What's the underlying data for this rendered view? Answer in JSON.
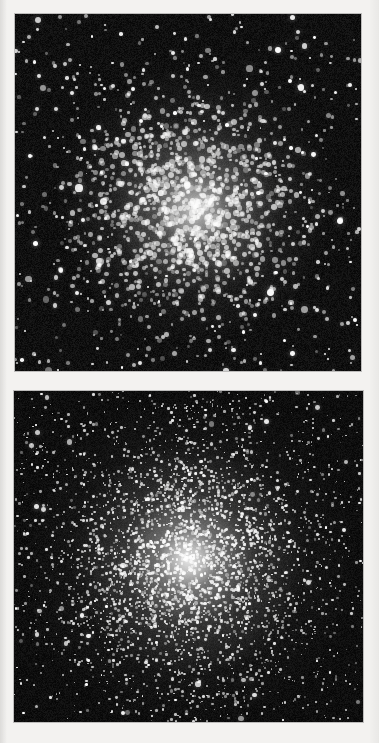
{
  "page": {
    "background_color": "#f3f2f0",
    "width": 379,
    "height": 743,
    "caption": ""
  },
  "figure": {
    "type": "astronomical-image-pair",
    "panels": [
      {
        "id": "panel-a",
        "position": "top",
        "label": "",
        "background_color": "#050505",
        "star_color": "#ffffff",
        "x": 15,
        "y": 14,
        "width": 346,
        "height": 357,
        "cluster_center_x_pct": 52,
        "cluster_center_y_pct": 54,
        "appearance": "coarsely resolved cluster; large blobby stars, mottled grainy core, moderately sparse surrounding field",
        "core_brightness": "medium-high",
        "star_count_estimate": 1750
      },
      {
        "id": "panel-b",
        "position": "bottom",
        "label": "",
        "background_color": "#050505",
        "star_color": "#ffffff",
        "x": 14,
        "y": 391,
        "width": 349,
        "height": 331,
        "cluster_center_x_pct": 50,
        "cluster_center_y_pct": 51,
        "appearance": "densely packed cluster; fine pinpoint stars with a smooth saturated white core and broad symmetric halo",
        "core_brightness": "very high",
        "star_count_estimate": 3600
      }
    ]
  },
  "chart_data": {
    "type": "scatter",
    "title": "",
    "xlabel": "",
    "ylabel": "",
    "panels": [
      {
        "name": "upper globular cluster",
        "n_stars": 1750,
        "center": [
          0.52,
          0.54
        ],
        "core_radius_frac": 0.11,
        "halo_radius_frac": 0.4,
        "field_density": 0.3,
        "peak_intensity": 0.8
      },
      {
        "name": "lower globular cluster",
        "n_stars": 3600,
        "center": [
          0.5,
          0.51
        ],
        "core_radius_frac": 0.09,
        "halo_radius_frac": 0.5,
        "field_density": 0.22,
        "peak_intensity": 1.0
      }
    ]
  }
}
